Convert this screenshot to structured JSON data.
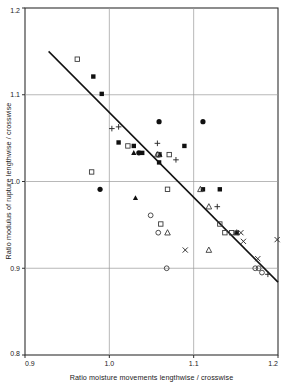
{
  "chart_data": {
    "type": "scatter",
    "title": "",
    "xlabel": "Ratio moisture movements lengthwise / crosswise",
    "ylabel": "Ratio modulus of rupture lengthwise / crosswise",
    "xlim": [
      0.9,
      1.2
    ],
    "ylim": [
      0.8,
      1.2
    ],
    "xticks": [
      "0.9",
      "1.0",
      "1.1",
      "1.2"
    ],
    "xtick_values": [
      0.9,
      1.0,
      1.1,
      1.2
    ],
    "yticks": [
      "0.8",
      "0.9",
      "1.0",
      "1.1",
      "1.2"
    ],
    "ytick_values": [
      0.8,
      0.9,
      1.0,
      1.1,
      1.2
    ],
    "grid": true,
    "grid_note": "horizontal gridlines at 0.9, 1.0, 1.1; vertical gridlines at 1.0, 1.1",
    "legend": null,
    "annotations": [],
    "trend_line": {
      "label": "regression line",
      "x_start": 0.928,
      "y_start": 1.15,
      "x_end": 1.2,
      "y_end": 0.884
    },
    "series": [
      {
        "name": "open-square",
        "marker": "open square",
        "points": [
          [
            0.962,
            1.141
          ],
          [
            1.022,
            1.041
          ],
          [
            0.979,
            1.011
          ],
          [
            1.059,
            1.031
          ],
          [
            1.071,
            1.031
          ],
          [
            1.069,
            0.991
          ],
          [
            1.061,
            0.951
          ],
          [
            1.131,
            0.951
          ],
          [
            1.137,
            0.941
          ],
          [
            1.145,
            0.941
          ]
        ]
      },
      {
        "name": "filled-square",
        "marker": "filled square",
        "points": [
          [
            0.981,
            1.121
          ],
          [
            0.991,
            1.101
          ],
          [
            1.011,
            1.045
          ],
          [
            1.029,
            1.041
          ],
          [
            1.039,
            1.033
          ],
          [
            1.059,
            1.022
          ],
          [
            1.089,
            1.041
          ],
          [
            1.111,
            0.991
          ],
          [
            1.131,
            0.991
          ],
          [
            1.151,
            0.941
          ]
        ]
      },
      {
        "name": "filled-circle",
        "marker": "filled circle",
        "points": [
          [
            0.989,
            0.991
          ],
          [
            1.059,
            1.069
          ],
          [
            1.111,
            1.069
          ],
          [
            1.035,
            1.033
          ]
        ]
      },
      {
        "name": "open-circle",
        "marker": "open circle",
        "points": [
          [
            1.058,
            1.031
          ],
          [
            1.049,
            0.961
          ],
          [
            1.058,
            0.941
          ],
          [
            1.068,
            0.9
          ],
          [
            1.173,
            0.9
          ],
          [
            1.177,
            0.9
          ],
          [
            1.181,
            0.895
          ]
        ]
      },
      {
        "name": "filled-triangle",
        "marker": "filled triangle",
        "points": [
          [
            1.029,
            1.033
          ],
          [
            1.031,
            0.981
          ],
          [
            1.06,
            1.031
          ]
        ]
      },
      {
        "name": "open-triangle",
        "marker": "open triangle",
        "points": [
          [
            1.057,
            1.031
          ],
          [
            1.108,
            0.991
          ],
          [
            1.118,
            0.971
          ],
          [
            1.069,
            0.941
          ],
          [
            1.118,
            0.921
          ],
          [
            1.151,
            0.941
          ]
        ]
      },
      {
        "name": "plus",
        "marker": "plus",
        "points": [
          [
            1.003,
            1.061
          ],
          [
            1.011,
            1.063
          ],
          [
            1.057,
            1.044
          ],
          [
            1.079,
            1.025
          ],
          [
            1.128,
            0.971
          ],
          [
            1.188,
            0.893
          ]
        ]
      },
      {
        "name": "cross",
        "marker": "cross",
        "points": [
          [
            1.09,
            0.921
          ],
          [
            1.156,
            0.941
          ],
          [
            1.159,
            0.931
          ],
          [
            1.176,
            0.911
          ],
          [
            1.199,
            0.933
          ]
        ]
      }
    ]
  }
}
